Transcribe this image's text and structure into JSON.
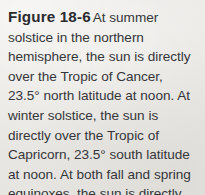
{
  "document": {
    "type": "textbook-figure-caption",
    "background_color": "#e9e8e5",
    "text_color": "#36363a"
  },
  "caption": {
    "label": "Figure 18-6",
    "text": "At summer solstice in the northern hemisphere, the sun is directly over the Tropic of Cancer, 23.5° north latitude at noon. At winter solstice, the sun is directly over the Tropic of Capricorn, 23.5° south latitude at noon. At both fall and spring equinoxes, the sun is directly over the equator at noon.",
    "lines": [
      "Figure 18-6 At summer sol-",
      "stice in the northern hemisphere,",
      "the sun is directly over the Tropic",
      "of Cancer, 23.5° north latitude at",
      "noon. At winter solstice, the sun",
      "is directly over the Tropic of",
      "Capricorn, 23.5° south latitude at",
      "noon. At both fall and spring",
      "equinoxes, the sun is directly over",
      "the equator at noon."
    ],
    "figure_number": "18-6",
    "values_mentioned": [
      "23.5°",
      "23.5°"
    ]
  }
}
